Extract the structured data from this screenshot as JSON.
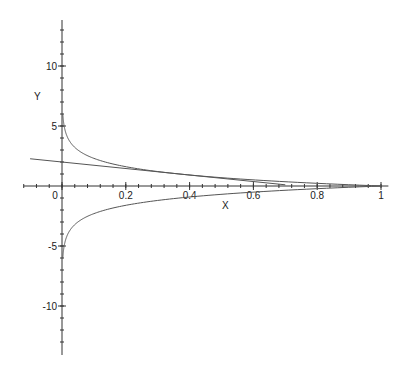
{
  "chart_data": {
    "type": "line",
    "title": "",
    "xlabel": "X",
    "ylabel": "Y",
    "xlim": [
      -0.12,
      1.02
    ],
    "ylim": [
      -14,
      14
    ],
    "grid": false,
    "legend": null,
    "x_ticks": [
      0,
      0.2,
      0.4,
      0.6,
      0.8,
      1
    ],
    "x_tick_labels": [
      "0",
      "0.2",
      "0.4",
      "0.6",
      "0.8",
      "1"
    ],
    "x_minor_step": 0.04,
    "y_ticks": [
      -10,
      -5,
      5,
      10
    ],
    "y_tick_labels": [
      "-10",
      "-5",
      "5",
      "10"
    ],
    "y_minor_step": 1,
    "series": [
      {
        "name": "upper branch y = -ln(x)",
        "x": [
          0.0025,
          0.005,
          0.01,
          0.02,
          0.05,
          0.1,
          0.2,
          0.3,
          0.4,
          0.5,
          0.6,
          0.7,
          0.8,
          0.9,
          1.0
        ],
        "y": [
          5.99,
          5.3,
          4.61,
          3.91,
          3.0,
          2.3,
          1.61,
          1.2,
          0.92,
          0.69,
          0.51,
          0.36,
          0.22,
          0.11,
          0.0
        ]
      },
      {
        "name": "lower branch y = ln(x)",
        "x": [
          0.0025,
          0.005,
          0.01,
          0.02,
          0.05,
          0.1,
          0.2,
          0.3,
          0.4,
          0.5,
          0.6,
          0.7,
          0.8,
          0.9,
          1.0
        ],
        "y": [
          -5.99,
          -5.3,
          -4.61,
          -3.91,
          -3.0,
          -2.3,
          -1.61,
          -1.2,
          -0.92,
          -0.69,
          -0.51,
          -0.36,
          -0.22,
          -0.11,
          0.0
        ]
      },
      {
        "name": "tangent line y = 2 - e*x",
        "x": [
          -0.1,
          0.7
        ],
        "y": [
          2.27,
          0.1
        ]
      }
    ]
  },
  "axes": {
    "x_label": "X",
    "y_label": "Y"
  },
  "colors": {
    "axis": "#333333",
    "curve": "#555555",
    "text": "#222222"
  }
}
